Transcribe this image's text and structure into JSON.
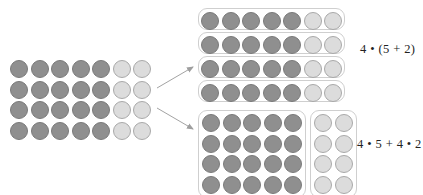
{
  "figure": {
    "background_color": "#ffffff",
    "colors": {
      "dark_dot_fill": "#8f8f8f",
      "dark_dot_stroke": "#7a7a7a",
      "light_dot_fill": "#dcdcdc",
      "light_dot_stroke": "#a9a9a9",
      "box_stroke": "#cfcfcf",
      "arrow_stroke": "#a0a0a0",
      "text_color": "#222222"
    }
  },
  "source_array": {
    "name": "source-array",
    "rows": 4,
    "columns": 7,
    "dark_columns": 5,
    "light_columns": 2,
    "total_dots": 28,
    "dot_colors": [
      [
        "dark",
        "dark",
        "dark",
        "dark",
        "dark",
        "light",
        "light"
      ],
      [
        "dark",
        "dark",
        "dark",
        "dark",
        "dark",
        "light",
        "light"
      ],
      [
        "dark",
        "dark",
        "dark",
        "dark",
        "dark",
        "light",
        "light"
      ],
      [
        "dark",
        "dark",
        "dark",
        "dark",
        "dark",
        "light",
        "light"
      ]
    ]
  },
  "top_grouping": {
    "name": "row-grouped-array",
    "description": "four rows of seven, each row boxed",
    "rows": 4,
    "columns": 7,
    "boxes": 4,
    "box_contents_per_box": 7,
    "dot_colors": [
      [
        "dark",
        "dark",
        "dark",
        "dark",
        "dark",
        "light",
        "light"
      ],
      [
        "dark",
        "dark",
        "dark",
        "dark",
        "dark",
        "light",
        "light"
      ],
      [
        "dark",
        "dark",
        "dark",
        "dark",
        "dark",
        "light",
        "light"
      ],
      [
        "dark",
        "dark",
        "dark",
        "dark",
        "dark",
        "light",
        "light"
      ]
    ],
    "equation": "4 • (5 + 2)"
  },
  "bottom_grouping": {
    "name": "column-grouped-array",
    "description": "a 4 by 5 block and a 4 by 2 block, each boxed",
    "boxes": 2,
    "left_box": {
      "name": "dark-block",
      "rows": 4,
      "columns": 5,
      "color": "dark",
      "total_dots": 20
    },
    "right_box": {
      "name": "light-block",
      "rows": 4,
      "columns": 2,
      "color": "light",
      "total_dots": 8
    },
    "equation": "4 • 5 + 4 • 2"
  },
  "arrows": [
    {
      "name": "arrow-to-top-grouping",
      "direction": "up-right"
    },
    {
      "name": "arrow-to-bottom-grouping",
      "direction": "down-right"
    }
  ]
}
